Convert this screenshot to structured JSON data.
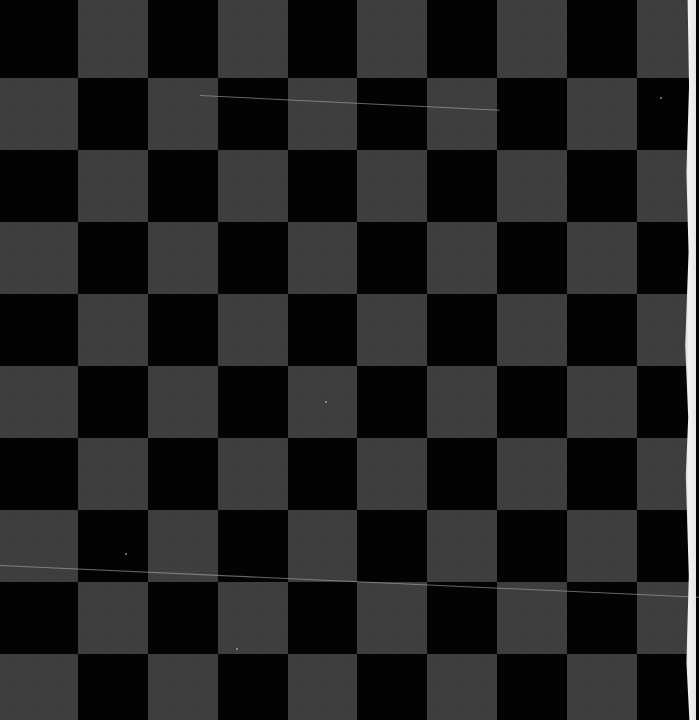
{
  "image": {
    "subject": "checkerboard pattern photo",
    "columns_visible": 10,
    "rows_visible": 10,
    "first_cell_color": "dark",
    "colors": {
      "dark": "#030303",
      "light": "#3d3d3d",
      "paper_edge": "#e8e8e8"
    },
    "col_edges": [
      0,
      78,
      148,
      218,
      288,
      357,
      427,
      497,
      567,
      637,
      696
    ],
    "row_edges": [
      0,
      78,
      150,
      222,
      294,
      366,
      438,
      510,
      582,
      654,
      720
    ],
    "artifacts": {
      "scratches": [
        {
          "x": 0,
          "y": 565,
          "length": 700,
          "angle_deg": 2.6
        },
        {
          "x": 200,
          "y": 95,
          "length": 300,
          "angle_deg": 2.8
        }
      ],
      "specks": [
        {
          "x": 236,
          "y": 648
        },
        {
          "x": 125,
          "y": 553
        },
        {
          "x": 660,
          "y": 97
        },
        {
          "x": 325,
          "y": 401
        }
      ],
      "torn_right_edge": true
    }
  }
}
